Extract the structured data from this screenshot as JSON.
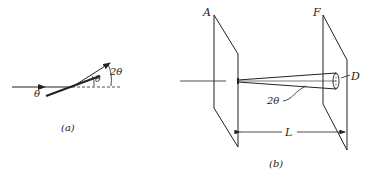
{
  "figure_a": {
    "caption": "(a)",
    "labels": {
      "incident_angle": "θ",
      "mirror_angle": "θ",
      "deflection": "2θ"
    }
  },
  "figure_b": {
    "caption": "(b)",
    "labels": {
      "plate_a": "A",
      "plate_f": "F",
      "spot_diameter": "D",
      "cone_angle": "2θ",
      "distance": "L"
    }
  },
  "colors": {
    "ink": "#222222",
    "background": "#ffffff"
  }
}
